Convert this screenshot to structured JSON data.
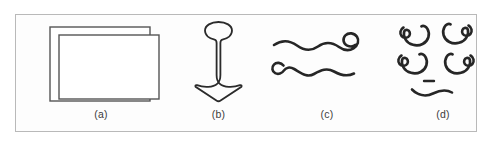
{
  "figure": {
    "background_color": "#ffffff",
    "frame_color": "#b9b9b9",
    "ink_color": "#262626",
    "panel_label_color": "#3b3b3b",
    "subfigures": [
      {
        "key": "a",
        "label": "(a)",
        "icon_name": "nested-offset-rectangles-drawing",
        "description": "Two overlapping rectangle outlines, inner rectangle offset right and down"
      },
      {
        "key": "b",
        "label": "(b)",
        "icon_name": "anchor-arrow-drawing",
        "description": "Anchor-like outline with rounded bulb head, tapering stem and flared pointed arrowhead"
      },
      {
        "key": "c",
        "label": "(c)",
        "icon_name": "wavy-lines-with-spiral-curls-drawing",
        "description": "Two horizontal wavy lines, upper ends in a spiral curl at right, lower starts with a small curl at left"
      },
      {
        "key": "d",
        "label": "(d)",
        "icon_name": "spiral-curl-motifs-drawing",
        "description": "Four C-shaped spiral curl motifs in a two by two arrangement above a short dash and a small wavy line"
      }
    ]
  }
}
